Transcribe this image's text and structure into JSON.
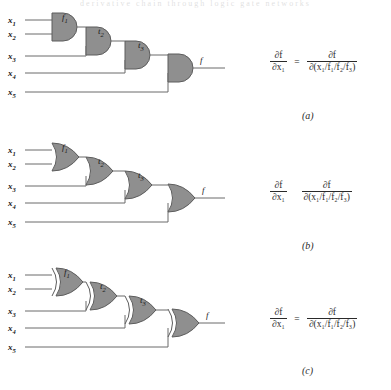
{
  "figure": {
    "cut_header": "derivative chain through logic gate networks",
    "panels": [
      {
        "id": "a",
        "caption": "(a)",
        "gate_type": "AND",
        "gate_symbol": "and-gate",
        "inputs": [
          "x₁",
          "x₂",
          "x₃",
          "x₄",
          "x₅"
        ],
        "intermediate_signals": [
          "f₁",
          "t₂",
          "t₃"
        ],
        "output": "f",
        "equation": {
          "lhs_num": "∂f",
          "lhs_den": "∂x₁",
          "relation": "=",
          "rhs_num": "∂f",
          "rhs_den": "∂(x₁/f₁/f₂/f₃)"
        }
      },
      {
        "id": "b",
        "caption": "(b)",
        "gate_type": "OR",
        "gate_symbol": "or-gate",
        "inputs": [
          "x₁",
          "x₂",
          "x₃",
          "x₄",
          "x₅"
        ],
        "intermediate_signals": [
          "f₁",
          "t₂",
          "t₃"
        ],
        "output": "f",
        "equation": {
          "lhs_num": "∂f",
          "lhs_den": "∂x₁",
          "relation": "",
          "rhs_num": "∂f",
          "rhs_den": "∂(x₁/f₁/f₂/f₃)"
        }
      },
      {
        "id": "c",
        "caption": "(c)",
        "gate_type": "XOR",
        "gate_symbol": "xor-gate",
        "inputs": [
          "x₁",
          "x₂",
          "x₃",
          "x₄",
          "x₅"
        ],
        "intermediate_signals": [
          "f₁",
          "t₂",
          "t₃"
        ],
        "output": "f",
        "equation": {
          "lhs_num": "∂f",
          "lhs_den": "∂x₁",
          "relation": "=",
          "rhs_num": "∂f",
          "rhs_den": "∂(x₁/f₁/f₂/f₃)"
        }
      }
    ]
  }
}
